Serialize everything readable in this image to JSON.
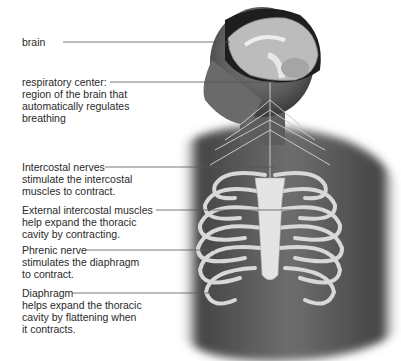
{
  "diagram": {
    "labels": [
      {
        "id": "brain",
        "text": "brain"
      },
      {
        "id": "respiratory-center",
        "text": "respiratory center:\nregion of the brain that\nautomatically regulates\nbreathing"
      },
      {
        "id": "intercostal-nerves",
        "text": "Intercostal nerves\nstimulate the intercostal\nmuscles to contract."
      },
      {
        "id": "external-intercostal-muscles",
        "text": "External intercostal muscles\nhelp expand the thoracic\ncavity by contracting."
      },
      {
        "id": "phrenic-nerve",
        "text": "Phrenic nerve\nstimulates the diaphragm\nto contract."
      },
      {
        "id": "diaphragm",
        "text": "Diaphragm\nhelps expand the thoracic\ncavity by flattening when\nit contracts."
      }
    ]
  }
}
